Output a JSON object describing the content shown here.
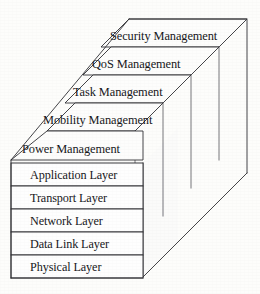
{
  "figure": {
    "background_color": "#fdfdfb",
    "line_color": "#2f2f33",
    "text_color": "#17171a"
  },
  "management_planes": [
    {
      "id": "security",
      "label": "Security Management"
    },
    {
      "id": "qos",
      "label": "QoS Management"
    },
    {
      "id": "task",
      "label": "Task Management"
    },
    {
      "id": "mobility",
      "label": "Mobility Management"
    },
    {
      "id": "power",
      "label": "Power Management"
    }
  ],
  "protocol_layers": [
    {
      "id": "application",
      "label": "Application Layer"
    },
    {
      "id": "transport",
      "label": "Transport Layer"
    },
    {
      "id": "network",
      "label": "Network Layer"
    },
    {
      "id": "datalink",
      "label": "Data Link Layer"
    },
    {
      "id": "physical",
      "label": "Physical Layer"
    }
  ]
}
